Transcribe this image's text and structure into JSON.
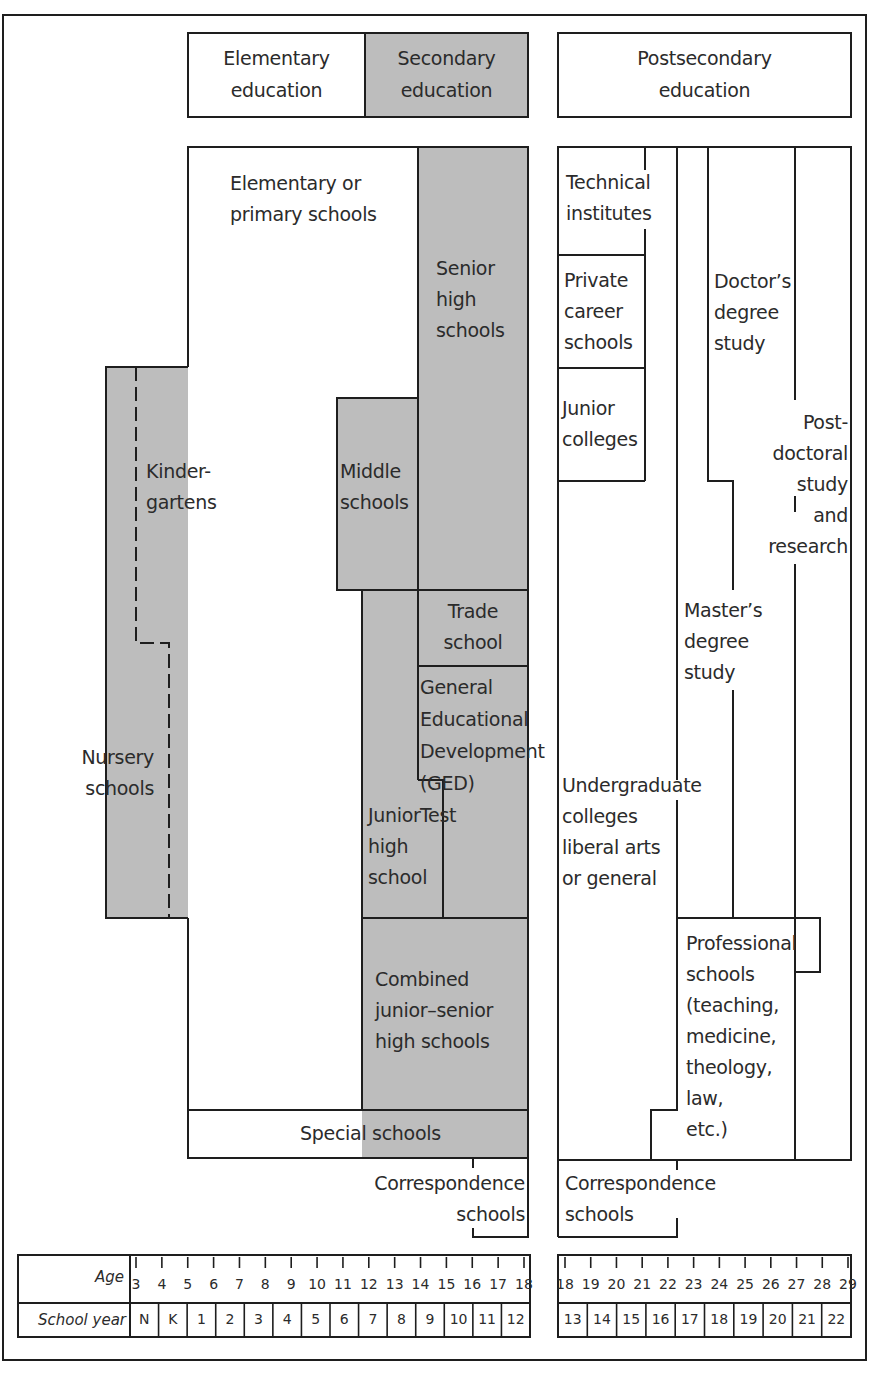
{
  "colors": {
    "shade": "#bdbdbd",
    "line": "#1e1e1e",
    "background": "#ffffff"
  },
  "header": {
    "elementary": "Elementary\neducation",
    "secondary": "Secondary\neducation",
    "postsecondary": "Postsecondary\neducation"
  },
  "elementary_secondary": {
    "elementary_primary": "Elementary or\nprimary schools",
    "senior_high": "Senior\nhigh\nschools",
    "kindergartens": "Kinder-\ngartens",
    "nursery": "Nursery\nschools",
    "middle": "Middle\nschools",
    "trade": "Trade\nschool",
    "ged": "General\nEducational\nDevelopment\n(GED)\nTest",
    "junior_high": "Junior\nhigh\nschool",
    "combined": "Combined\njunior–senior\nhigh schools",
    "special": "Special schools",
    "correspondence": "Correspondence\nschools"
  },
  "postsecondary": {
    "technical": "Technical\ninstitutes",
    "private_career": "Private\ncareer\nschools",
    "junior_colleges": "Junior\ncolleges",
    "doctors": "Doctor’s\ndegree\nstudy",
    "postdoctoral": "Post-\ndoctoral\nstudy\nand\nresearch",
    "masters": "Master’s\ndegree\nstudy",
    "undergraduate": "Undergraduate\ncolleges\nliberal arts\nor general",
    "professional": "Professional\nschools\n(teaching,\nmedicine,\ntheology,\nlaw,\netc.)",
    "correspondence": "Correspondence\nschools"
  },
  "scale": {
    "age_label": "Age",
    "school_year_label": "School year",
    "left_ages": [
      "3",
      "4",
      "5",
      "6",
      "7",
      "8",
      "9",
      "10",
      "11",
      "12",
      "13",
      "14",
      "15",
      "16",
      "17",
      "18"
    ],
    "left_years": [
      "N",
      "K",
      "1",
      "2",
      "3",
      "4",
      "5",
      "6",
      "7",
      "8",
      "9",
      "10",
      "11",
      "12"
    ],
    "right_ages": [
      "18",
      "19",
      "20",
      "21",
      "22",
      "23",
      "24",
      "25",
      "26",
      "27",
      "28",
      "29"
    ],
    "right_years": [
      "13",
      "14",
      "15",
      "16",
      "17",
      "18",
      "19",
      "20",
      "21",
      "22"
    ]
  }
}
